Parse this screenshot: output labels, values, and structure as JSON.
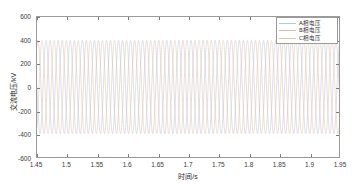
{
  "chart_data": {
    "type": "line",
    "title": "",
    "xlabel": "时间/s",
    "ylabel": "交流电压/kV",
    "xlim": [
      1.45,
      1.95
    ],
    "ylim": [
      -600,
      600
    ],
    "xticks": [
      "1.45",
      "1.5",
      "1.55",
      "1.6",
      "1.65",
      "1.7",
      "1.75",
      "1.8",
      "1.85",
      "1.9",
      "1.95"
    ],
    "xtick_values": [
      1.45,
      1.5,
      1.55,
      1.6,
      1.65,
      1.7,
      1.75,
      1.8,
      1.85,
      1.9,
      1.95
    ],
    "yticks": [
      "600",
      "400",
      "200",
      "0",
      "-200",
      "-400",
      "-600"
    ],
    "ytick_values": [
      600,
      400,
      200,
      0,
      -200,
      -400,
      -600
    ],
    "grid": false,
    "legend_position": "upper right",
    "frequency_hz": 50,
    "amplitude_kv": 400,
    "sample_count": 3000,
    "series": [
      {
        "name": "A相电压",
        "color": "#bfc6d4",
        "phase_deg": 0,
        "amplitude": 400,
        "frequency": 50
      },
      {
        "name": "B相电压",
        "color": "#d6bdbd",
        "phase_deg": -120,
        "amplitude": 400,
        "frequency": 50
      },
      {
        "name": "C相电压",
        "color": "#dccab3",
        "phase_deg": 120,
        "amplitude": 400,
        "frequency": 50
      }
    ]
  },
  "figure": {
    "axis_color": "#9a9a9a",
    "tick_color": "#7d7d7d",
    "text_color": "#3a3a3a",
    "background": "#ffffff"
  },
  "legend": {
    "items": [
      {
        "label": "A相电压"
      },
      {
        "label": "B相电压"
      },
      {
        "label": "C相电压"
      }
    ]
  }
}
